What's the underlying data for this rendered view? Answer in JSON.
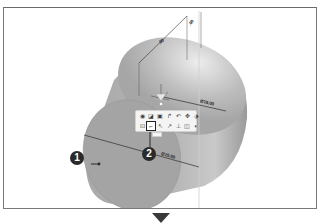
{
  "viewport": {
    "model": "cylinder",
    "background": "#ffffff",
    "body_color": "#a3a3a3",
    "edge_color": "#8a8a8a"
  },
  "dimensions": {
    "face_diameter": "Ø15.00",
    "back_diameter": "Ø15.00",
    "length_a": ".00",
    "length_b": ".00"
  },
  "context_toolbar": {
    "row1": [
      {
        "icon": "view-orient-icon",
        "glyph": "◉"
      },
      {
        "icon": "edit-feature-icon",
        "glyph": "◪"
      },
      {
        "icon": "sketch-icon",
        "glyph": "▣"
      },
      {
        "icon": "rotate-icon",
        "glyph": "↱"
      },
      {
        "icon": "undo-icon",
        "glyph": "↶"
      },
      {
        "icon": "appearance-icon",
        "glyph": "✥"
      },
      {
        "icon": "more-icon",
        "glyph": "·"
      },
      {
        "icon": "normal-to-icon",
        "glyph": "⬗"
      }
    ],
    "row2": [
      {
        "icon": "select-other-icon",
        "glyph": "⊡"
      },
      {
        "icon": "sketch-line-icon",
        "glyph": "⌐",
        "selected": true
      },
      {
        "icon": "pointer-icon",
        "glyph": "↖"
      },
      {
        "icon": "smart-dimension-icon",
        "glyph": "↗"
      },
      {
        "icon": "perpendicular-icon",
        "glyph": "⊥"
      },
      {
        "icon": "hide-show-icon",
        "glyph": "◫"
      },
      {
        "icon": "zoom-selection-icon",
        "glyph": "◐"
      }
    ]
  },
  "callouts": [
    {
      "number": "1",
      "target": "cylinder-face"
    },
    {
      "number": "2",
      "target": "sketch-toolbar-button"
    }
  ],
  "next_step_indicator": "down-arrow"
}
